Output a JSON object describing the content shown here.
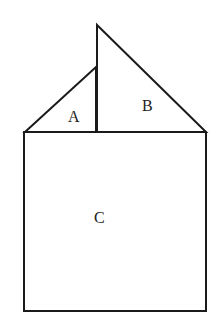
{
  "diagram": {
    "labels": {
      "a": "A",
      "b": "B",
      "c": "C"
    },
    "shapes": [
      {
        "id": "A",
        "type": "right-triangle",
        "description": "small triangle left of vertical line"
      },
      {
        "id": "B",
        "type": "right-triangle",
        "description": "tall triangle right of vertical line"
      },
      {
        "id": "C",
        "type": "square",
        "description": "square below triangles"
      }
    ],
    "colors": {
      "stroke": "#1a1a1a",
      "background": "#ffffff"
    }
  }
}
